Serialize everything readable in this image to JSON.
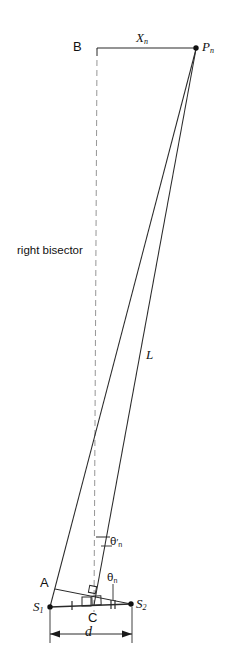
{
  "figure": {
    "background_color": "#ffffff",
    "line_color": "#1a1a1a",
    "dashed_color": "#8a8a8a"
  },
  "labels": {
    "point_b": "B",
    "point_pn_base": "P",
    "point_pn_sub": "n",
    "segment_xn_base": "X",
    "segment_xn_sub": "n",
    "bisector_text": "right bisector",
    "segment_l": "L",
    "angle_theta_prime_base": "θ",
    "angle_theta_prime_mark": "′",
    "angle_theta_prime_sub": "n",
    "angle_theta_base": "θ",
    "angle_theta_sub": "n",
    "point_a": "A",
    "point_s1_base": "S",
    "point_s1_sub": "1",
    "point_c": "C",
    "point_s2_base": "S",
    "point_s2_sub": "2",
    "dimension_d": "d"
  },
  "geometry": {
    "point_b": {
      "x": 97,
      "y": 48
    },
    "point_pn": {
      "x": 196,
      "y": 48
    },
    "point_s1": {
      "x": 50,
      "y": 607
    },
    "point_c": {
      "x": 94,
      "y": 604
    },
    "point_s2": {
      "x": 131,
      "y": 604
    },
    "point_a": {
      "x": 55,
      "y": 588
    },
    "bisector_top": {
      "x": 97,
      "y": 48
    },
    "bisector_bottom": {
      "x": 94,
      "y": 612
    },
    "dimension_line_y": 634,
    "dimension_left_x": 50,
    "dimension_right_x": 132,
    "tick_left_x": 72,
    "tick_right_x": 113
  }
}
